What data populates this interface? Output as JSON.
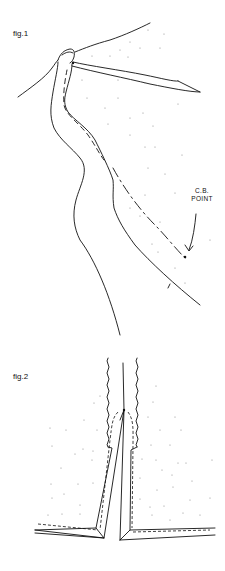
{
  "figures": [
    {
      "label": "fig.1",
      "annotation": {
        "line1": "C.B.",
        "line2": "POINT"
      }
    },
    {
      "label": "fig.2"
    }
  ],
  "colors": {
    "ink": "#111111",
    "dots": "#8a8a8a",
    "background": "#ffffff"
  }
}
